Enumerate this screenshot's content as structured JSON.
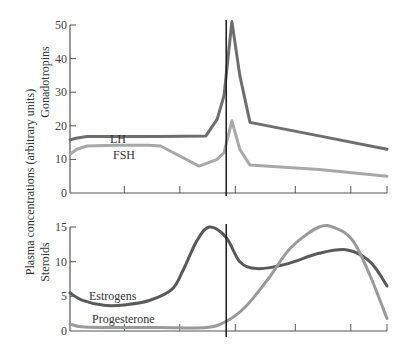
{
  "chart_data": [
    {
      "type": "line",
      "title": "Gonadotropins",
      "ylabel": "Gonadotropins",
      "ylim": [
        0,
        50
      ],
      "yticks": [
        0,
        10,
        20,
        30,
        40,
        50
      ],
      "xlim": [
        0,
        28
      ],
      "xticks": [
        4.8,
        9.7,
        14.6,
        19.9,
        24.8,
        28
      ],
      "grid": false,
      "ovulation_marker_x": 13.8,
      "series": [
        {
          "name": "LH",
          "color": "#6e6e6e",
          "x": [
            0,
            0.5,
            1.5,
            4,
            8,
            12,
            13,
            13.6,
            14.3,
            15,
            15.9,
            22,
            28
          ],
          "y": [
            15.8,
            16.3,
            16.8,
            16.8,
            16.8,
            17,
            22,
            29,
            51,
            35,
            21,
            17,
            13
          ]
        },
        {
          "name": "FSH",
          "color": "#a8a8a8",
          "x": [
            0,
            0.6,
            1.5,
            4,
            7,
            8,
            11.4,
            13,
            13.6,
            14.3,
            15,
            15.9,
            22,
            28
          ],
          "y": [
            11.5,
            13,
            14,
            14.2,
            14.2,
            14,
            8,
            10,
            12,
            21.5,
            13,
            8.3,
            7,
            5
          ]
        }
      ]
    },
    {
      "type": "line",
      "title": "Steroids",
      "ylabel": "Steroids",
      "ylim": [
        0,
        15
      ],
      "yticks": [
        0,
        5,
        10,
        15
      ],
      "xlim": [
        0,
        28
      ],
      "xticks": [
        4.8,
        9.7,
        14.6,
        19.9,
        24.8,
        28
      ],
      "grid": false,
      "ovulation_marker_x": 13.8,
      "series": [
        {
          "name": "Estrogens",
          "color": "#5a5a5a",
          "x": [
            0,
            1,
            3,
            5,
            7,
            9,
            10,
            11.2,
            12.3,
            13.8,
            15,
            16.5,
            19,
            22,
            24.5,
            26.5,
            28
          ],
          "y": [
            5.5,
            4.5,
            3.7,
            3.8,
            4.4,
            6,
            8.8,
            13,
            15,
            13.5,
            10,
            9,
            9.6,
            11.2,
            11.7,
            10,
            6.5
          ]
        },
        {
          "name": "Progesterone",
          "color": "#9a9a9a",
          "x": [
            0,
            1,
            3,
            8,
            12,
            13.8,
            15.5,
            17.5,
            19.5,
            22,
            23.5,
            25,
            26.5,
            28
          ],
          "y": [
            1,
            0.6,
            0.5,
            0.5,
            0.5,
            1.4,
            3.5,
            7.5,
            12,
            15,
            14.8,
            13,
            8,
            1.8
          ]
        }
      ]
    }
  ],
  "labels": {
    "y_axis_main": "Plasma concentrations (arbitrary units)",
    "top_panel": "Gonadotropins",
    "bottom_panel": "Steroids",
    "lh": "LH",
    "fsh": "FSH",
    "estrogens": "Estrogens",
    "progesterone": "Progesterone"
  }
}
